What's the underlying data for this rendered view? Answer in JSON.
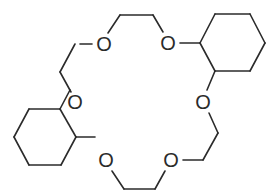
{
  "molecule": {
    "name": "dicyclohexano-18-crown-6",
    "stroke_color": "#2b2b2b",
    "atoms": [
      {
        "id": "o1",
        "label": "O",
        "x": 104,
        "y": 44
      },
      {
        "id": "o2",
        "label": "O",
        "x": 168,
        "y": 43
      },
      {
        "id": "o3",
        "label": "O",
        "x": 75,
        "y": 102
      },
      {
        "id": "o4",
        "label": "O",
        "x": 203,
        "y": 102
      },
      {
        "id": "o5",
        "label": "O",
        "x": 106,
        "y": 160
      },
      {
        "id": "o6",
        "label": "O",
        "x": 171,
        "y": 160
      }
    ],
    "bonds": [
      [
        80,
        44,
        92,
        44
      ],
      [
        60,
        72,
        75,
        44
      ],
      [
        60,
        72,
        71,
        92
      ],
      [
        108,
        33,
        120,
        15
      ],
      [
        120,
        15,
        153,
        15
      ],
      [
        153,
        15,
        163,
        32
      ],
      [
        180,
        43,
        200,
        43
      ],
      [
        200,
        43,
        215,
        14
      ],
      [
        215,
        14,
        250,
        14
      ],
      [
        250,
        14,
        265,
        43
      ],
      [
        265,
        43,
        250,
        71
      ],
      [
        250,
        71,
        215,
        71
      ],
      [
        215,
        71,
        200,
        43
      ],
      [
        215,
        71,
        207,
        90
      ],
      [
        70,
        90,
        60,
        109
      ],
      [
        60,
        109,
        29,
        109
      ],
      [
        29,
        109,
        14,
        137
      ],
      [
        14,
        137,
        29,
        165
      ],
      [
        29,
        165,
        61,
        165
      ],
      [
        61,
        165,
        76,
        137
      ],
      [
        76,
        137,
        60,
        109
      ],
      [
        76,
        137,
        95,
        137
      ],
      [
        112,
        171,
        124,
        189
      ],
      [
        124,
        189,
        155,
        189
      ],
      [
        155,
        189,
        165,
        171
      ],
      [
        183,
        160,
        203,
        160
      ],
      [
        203,
        160,
        218,
        133
      ],
      [
        218,
        133,
        209,
        113
      ]
    ]
  }
}
